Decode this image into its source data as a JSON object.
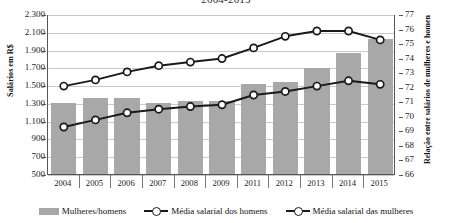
{
  "title": "2004-2015",
  "axes": {
    "left_title": "Salários em R$",
    "right_title": "Relação entre salários de mulheres e homen",
    "left_ticks": [
      "2.300",
      "2.100",
      "1.900",
      "1.700",
      "1.500",
      "1.300",
      "1.100",
      "900",
      "700",
      "500"
    ],
    "right_ticks": [
      "77",
      "76",
      "75",
      "74",
      "73",
      "72",
      "71",
      "70",
      "69",
      "68",
      "67",
      "66"
    ]
  },
  "legend": {
    "items": [
      {
        "label": "Mulheres/homens",
        "marker": "bar-swatch",
        "color": "#a8a8a8"
      },
      {
        "label": "Média salarial dos homens",
        "marker": "line-circle",
        "color": "#1a1a1a"
      },
      {
        "label": "Média salarial das mulheres",
        "marker": "line-circle",
        "color": "#1a1a1a"
      }
    ]
  },
  "chart_data": {
    "type": "bar",
    "title": "2004-2015",
    "xlabel": "",
    "ylabel": "Salários em R$",
    "y2label": "Relação entre salários de mulheres e homens",
    "categories": [
      "2004",
      "2005",
      "2006",
      "2007",
      "2008",
      "2009",
      "2011",
      "2012",
      "2013",
      "2014",
      "2015"
    ],
    "ylim": [
      500,
      2300
    ],
    "y2lim": [
      66,
      77
    ],
    "grid": true,
    "legend_position": "bottom",
    "series": [
      {
        "name": "Mulheres/homens",
        "type": "bar",
        "axis": "y2",
        "color": "#a8a8a8",
        "values": [
          70.9,
          71.2,
          71.2,
          70.9,
          71.0,
          71.0,
          72.2,
          72.3,
          73.3,
          74.3,
          75.3
        ]
      },
      {
        "name": "Média salarial dos homens",
        "type": "line",
        "axis": "y",
        "color": "#1a1a1a",
        "values": [
          1500,
          1570,
          1660,
          1730,
          1770,
          1810,
          1930,
          2060,
          2120,
          2120,
          2020
        ]
      },
      {
        "name": "Média salarial das mulheres",
        "type": "line",
        "axis": "y",
        "color": "#1a1a1a",
        "values": [
          1040,
          1120,
          1200,
          1240,
          1270,
          1290,
          1400,
          1440,
          1500,
          1560,
          1520
        ]
      }
    ]
  }
}
